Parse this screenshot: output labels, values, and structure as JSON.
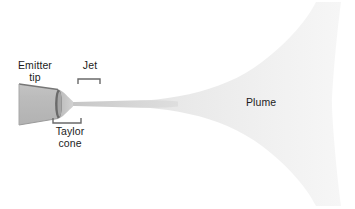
{
  "figure": {
    "kind": "electrospray-emitter-schematic",
    "background_color": "#ffffff",
    "width": 355,
    "height": 209
  },
  "labels": {
    "emitter_tip": "Emitter\ntip",
    "jet": "Jet",
    "taylor_cone": "Taylor\ncone",
    "plume": "Plume"
  },
  "colors": {
    "text": "#1c1c1c",
    "emitter_body": "#b9b9b9",
    "emitter_edge": "#6e6e6e",
    "emitter_rim": "#5a5a5a",
    "taylor_cone": "#c8c8c8",
    "jet": "#d8d8d8",
    "plume_near": "#e2e2e2",
    "plume_far": "#f4f4f4",
    "bracket": "#666666"
  },
  "parts": [
    {
      "name": "emitter-tip",
      "shape": "truncated-cone",
      "label": "Emitter tip"
    },
    {
      "name": "taylor-cone",
      "shape": "cone",
      "label": "Taylor cone"
    },
    {
      "name": "jet",
      "shape": "thin-filament",
      "label": "Jet"
    },
    {
      "name": "plume",
      "shape": "flared-spray",
      "label": "Plume"
    }
  ],
  "brackets": [
    {
      "name": "jet-bracket",
      "orientation": "down",
      "x_start": 78,
      "x_end": 100,
      "y": 79
    },
    {
      "name": "taylor-cone-bracket",
      "orientation": "up",
      "x_start": 53,
      "x_end": 81,
      "y": 123
    }
  ]
}
